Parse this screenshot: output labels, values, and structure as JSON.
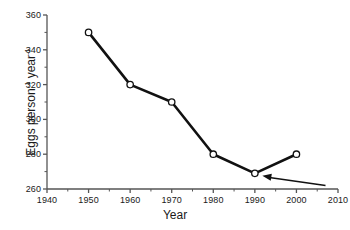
{
  "chart_data": {
    "type": "line",
    "title": "",
    "xlabel": "Year",
    "ylabel_parts": {
      "lead": "Eggs person",
      "sup1": "-1",
      "mid": " year",
      "sup2": "-1"
    },
    "ylabel": "Eggs person-1 year-1",
    "x": [
      1950,
      1960,
      1970,
      1980,
      1990,
      2000
    ],
    "values": [
      350,
      320,
      310,
      280,
      269,
      280
    ],
    "series": [
      {
        "name": "Eggs per person per year",
        "values": [
          350,
          320,
          310,
          280,
          269,
          280
        ]
      }
    ],
    "xlim": [
      1940,
      2010
    ],
    "ylim": [
      260,
      360
    ],
    "xticks": [
      1940,
      1950,
      1960,
      1970,
      1980,
      1990,
      2000,
      2010
    ],
    "xtick_labels": [
      "1940",
      "1950",
      "1960",
      "1970",
      "1980",
      "1990",
      "2000",
      "2010"
    ],
    "yticks": [
      260,
      280,
      300,
      320,
      340,
      360
    ],
    "ytick_labels": [
      "260",
      "280",
      "300",
      "320",
      "340",
      "360"
    ],
    "x_minor_step": 5,
    "y_minor_step": 10,
    "grid": false,
    "legend": "none",
    "marker": "open-circle",
    "line_color": "#111111",
    "marker_fill": "#ffffff",
    "axis_color": "#555555",
    "annotations": [
      {
        "type": "arrow",
        "label": "",
        "points_to_x": 1990,
        "points_to_y": 269,
        "from_x": 2007,
        "from_y": 262
      }
    ]
  }
}
